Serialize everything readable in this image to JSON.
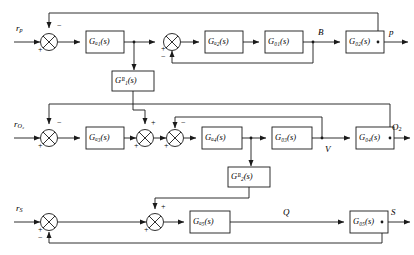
{
  "diagram": {
    "line_color": "#1a1a1a",
    "block_fill": "#ffffff"
  },
  "rows": {
    "row1": {
      "input_label": "r",
      "input_sub": "p",
      "output_label": "p",
      "mid_label": "B",
      "blocks": [
        {
          "name": "G",
          "sub": "a1",
          "arg": "(s)"
        },
        {
          "name": "G",
          "sub": "a2",
          "arg": "(s)"
        },
        {
          "name": "G",
          "sub": "01",
          "arg": "(s)"
        },
        {
          "name": "G",
          "sub": "02",
          "arg": "(s)"
        }
      ],
      "summers": [
        {
          "left": "+",
          "top": "−"
        },
        {
          "left": "+",
          "bottom": "−"
        }
      ]
    },
    "row2": {
      "input_label": "r",
      "input_sub": "O₂",
      "output_label": "O",
      "output_sub": "2",
      "mid_label": "V",
      "blocks": [
        {
          "name": "G",
          "sub": "a3",
          "arg": "(s)"
        },
        {
          "name": "G",
          "sub": "a4",
          "arg": "(s)"
        },
        {
          "name": "G",
          "sub": "03",
          "arg": "(s)"
        },
        {
          "name": "G",
          "sub": "04",
          "arg": "(s)"
        }
      ],
      "summers": [
        {
          "left": "+",
          "top": "−"
        },
        {
          "left": "+",
          "top": "+"
        },
        {
          "left": "+",
          "top": "−"
        }
      ]
    },
    "row3": {
      "input_label": "r",
      "input_sub": "S",
      "output_label": "S",
      "mid_label": "Q",
      "blocks": [
        {
          "name": "G",
          "sub": "a5",
          "arg": "(s)"
        },
        {
          "name": "G",
          "sub": "05",
          "arg": "(s)"
        }
      ],
      "summers": [
        {
          "left": "+",
          "bottom": "−"
        },
        {
          "left": "+",
          "top": "+"
        }
      ]
    }
  },
  "coupling_blocks": [
    {
      "name": "G",
      "sub": "B1",
      "arg": "(s)"
    },
    {
      "name": "G",
      "sub": "B2",
      "arg": "(s)"
    }
  ],
  "block_text": {
    "Ga1": "Gₐ₁(s)",
    "Ga2": "Gₐ₂(s)",
    "G01": "G₀₁(s)",
    "G02": "G₀₂(s)",
    "Ga3": "Gₐ₃(s)",
    "Ga4": "Gₐ₄(s)",
    "G03": "G₀₃(s)",
    "G04": "G₀₄(s)",
    "Ga5": "Gₐ₅(s)",
    "G05": "G₀₅(s)",
    "GB1": "Gᴮ₁(s)",
    "GB2": "Gᴮ₂(s)"
  }
}
